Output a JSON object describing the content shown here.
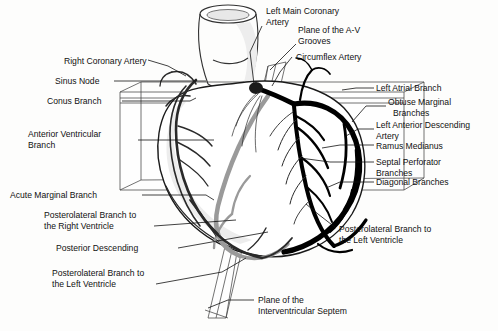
{
  "figure": {
    "background_color": "#fdfdfc",
    "line_color": "#111111",
    "vessel_dark_color": "#000000",
    "vessel_gray_color": "#9a9a9a"
  },
  "labels": {
    "right_coronary_artery": "Right Coronary Artery",
    "sinus_node": "Sinus Node",
    "conus_branch": "Conus Branch",
    "anterior_ventricular_branch_l1": "Anterior Ventricular",
    "anterior_ventricular_branch_l2": "Branch",
    "acute_marginal_branch": "Acute Marginal Branch",
    "postlat_right_l1": "Posterolateral Branch to",
    "postlat_right_l2": "the Right Ventricle",
    "posterior_descending": "Posterior Descending",
    "postlat_left_bl_l1": "Posterolateral Branch to",
    "postlat_left_bl_l2": "the Left Ventricle",
    "left_main_coronary_l1": "Left Main Coronary",
    "left_main_coronary_l2": "Artery",
    "plane_av_l1": "Plane of the A-V",
    "plane_av_l2": "Grooves",
    "circumflex_artery": "Circumflex Artery",
    "left_atrial_branch": "Left Atrial Branch",
    "obtuse_marginal_l1": "Obtuse Marginal",
    "obtuse_marginal_l2": "Branches",
    "lad_l1": "Left Anterior Descending",
    "lad_l2": "Artery",
    "ramus_medianus": "Ramus Medianus",
    "septal_perforator_l1": "Septal Perforator",
    "septal_perforator_l2": "Branches",
    "diagonal_branches": "Diagonal Branches",
    "postlat_left_br_l1": "Posterolateral Branch to",
    "postlat_left_br_l2": "the Left Ventricle",
    "plane_ivs_l1": "Plane of the",
    "plane_ivs_l2": "Interventricular Septem"
  }
}
